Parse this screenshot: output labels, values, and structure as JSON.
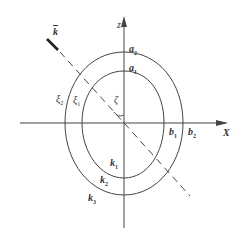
{
  "diagram": {
    "axes": {
      "x_label": "X",
      "z_label": "z"
    },
    "vector": {
      "label": "k",
      "overbar": true
    },
    "angle_label": "ζ",
    "inner_curve": {
      "top_label": "a",
      "top_sub": "1",
      "right_label": "b",
      "right_sub": "1",
      "left_label": "ξ",
      "left_sub": "1",
      "bottom_label": "k",
      "bottom_sub": "1"
    },
    "outer_curve": {
      "top_label": "a",
      "top_sub": "2",
      "right_label": "b",
      "right_sub": "2",
      "left_label": "ξ",
      "left_sub": "2",
      "bottom_label": "k",
      "bottom_sub": "2",
      "bottom2_label": "k",
      "bottom2_sub": "3"
    },
    "colors": {
      "line": "#444444",
      "background": "#ffffff"
    }
  }
}
